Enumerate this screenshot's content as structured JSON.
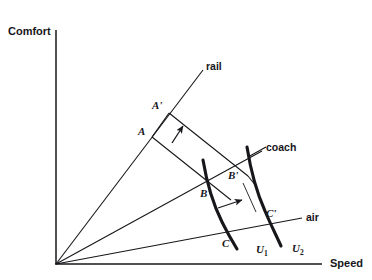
{
  "figure": {
    "title": "",
    "background_color": "#ffffff",
    "ink_color": "#17161a",
    "width": 372,
    "height": 280
  },
  "axes": {
    "y_label": "Comfort",
    "x_label": "Speed",
    "origin": {
      "x": 56,
      "y": 264
    },
    "y_axis_top": {
      "x": 56,
      "y": 30
    },
    "x_axis_right": {
      "x": 322,
      "y": 264
    }
  },
  "rays": [
    {
      "id": "rail",
      "label": "rail",
      "label_x": 206,
      "label_y": 61,
      "from": {
        "x": 56,
        "y": 264
      },
      "to": {
        "x": 203,
        "y": 70
      }
    },
    {
      "id": "coach",
      "label": "coach",
      "label_x": 266,
      "label_y": 142,
      "from": {
        "x": 56,
        "y": 264
      },
      "to": {
        "x": 262,
        "y": 151
      }
    },
    {
      "id": "air",
      "label": "air",
      "label_x": 306,
      "label_y": 212,
      "from": {
        "x": 56,
        "y": 264
      },
      "to": {
        "x": 302,
        "y": 218
      }
    }
  ],
  "points": [
    {
      "id": "A",
      "label": "A",
      "label_x": 138,
      "label_y": 126,
      "x": 152,
      "y": 137
    },
    {
      "id": "Ap",
      "label": "A'",
      "label_x": 152,
      "label_y": 100,
      "x": 169,
      "y": 113
    },
    {
      "id": "B",
      "label": "B",
      "label_x": 200,
      "label_y": 188,
      "x": 211,
      "y": 190
    },
    {
      "id": "Bp",
      "label": "B'",
      "label_x": 228,
      "label_y": 170,
      "x": 241,
      "y": 183
    },
    {
      "id": "C",
      "label": "C",
      "label_x": 222,
      "label_y": 238,
      "x": 232,
      "y": 238
    },
    {
      "id": "Cp",
      "label": "C'",
      "label_x": 266,
      "label_y": 208,
      "x": 268,
      "y": 216
    }
  ],
  "curves": [
    {
      "id": "U1",
      "label": "U",
      "subscript": "1",
      "label_x": 256,
      "label_y": 244
    },
    {
      "id": "U2",
      "label": "U",
      "subscript": "2",
      "label_x": 292,
      "label_y": 243
    }
  ],
  "arrows": [
    {
      "id": "arrow-upper",
      "from": {
        "x": 172,
        "y": 143
      },
      "to": {
        "x": 184,
        "y": 125
      }
    },
    {
      "id": "arrow-lower",
      "from": {
        "x": 218,
        "y": 208
      },
      "to": {
        "x": 243,
        "y": 199
      }
    }
  ]
}
